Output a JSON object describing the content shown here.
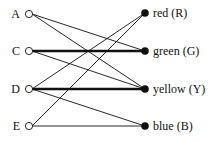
{
  "diagram": {
    "type": "bipartite-graph",
    "left_nodes": [
      {
        "id": "A",
        "label": "A",
        "x": 29,
        "y": 14
      },
      {
        "id": "C",
        "label": "C",
        "x": 29,
        "y": 51
      },
      {
        "id": "D",
        "label": "D",
        "x": 29,
        "y": 89
      },
      {
        "id": "E",
        "label": "E",
        "x": 29,
        "y": 126
      }
    ],
    "right_nodes": [
      {
        "id": "R",
        "label": "red (R)",
        "x": 145,
        "y": 13
      },
      {
        "id": "G",
        "label": "green (G)",
        "x": 145,
        "y": 51
      },
      {
        "id": "Y",
        "label": "yellow (Y)",
        "x": 145,
        "y": 89
      },
      {
        "id": "B",
        "label": "blue (B)",
        "x": 145,
        "y": 126
      }
    ],
    "edges": [
      {
        "from": "A",
        "to": "G",
        "thick": false
      },
      {
        "from": "A",
        "to": "Y",
        "thick": false
      },
      {
        "from": "C",
        "to": "G",
        "thick": true
      },
      {
        "from": "C",
        "to": "Y",
        "thick": false
      },
      {
        "from": "D",
        "to": "R",
        "thick": false
      },
      {
        "from": "D",
        "to": "Y",
        "thick": true
      },
      {
        "from": "D",
        "to": "B",
        "thick": false
      },
      {
        "from": "E",
        "to": "R",
        "thick": false
      },
      {
        "from": "E",
        "to": "B",
        "thick": false
      }
    ]
  }
}
